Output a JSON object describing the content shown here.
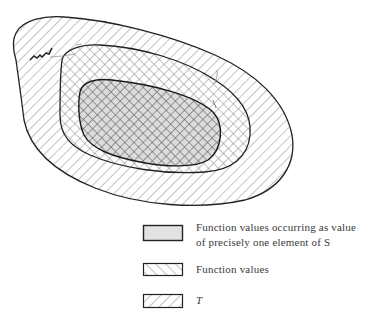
{
  "diagram": {
    "regions": [
      {
        "id": "outer",
        "label": "T",
        "pattern": "diagonal-backslash-hatch"
      },
      {
        "id": "middle",
        "label": "Function values",
        "pattern": "diagonal-forwardslash-hatch (crosshatched with T)"
      },
      {
        "id": "inner",
        "label": "Function values occurring as value of precisely one element of S",
        "pattern": "gray-fill (crosshatched)"
      }
    ],
    "colors": {
      "stroke": "#222222",
      "hatch": "#7a7a7a",
      "inner_fill": "#dcdcdc",
      "text": "#3a3a3a"
    }
  },
  "legend": {
    "items": [
      {
        "line1": "Function values occurring as value",
        "line2": "of precisely one  element of S",
        "swatch": "gray-fill"
      },
      {
        "line1": "Function values",
        "swatch": "forward-hatch"
      },
      {
        "line1": "T",
        "swatch": "back-hatch"
      }
    ]
  }
}
